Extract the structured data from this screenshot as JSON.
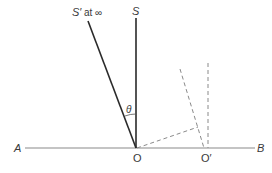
{
  "diagram": {
    "title": "",
    "labels": {
      "S": "S",
      "S_prime": "S′",
      "at_infinity": "at ∞",
      "theta": "θ",
      "A": "A",
      "B": "B",
      "O": "O",
      "O_prime": "O′"
    },
    "colors": {
      "line": "#2a2a2a",
      "baseline": "#8a8a8a",
      "dashed": "#8a8a8a",
      "text": "#3a3a3a"
    }
  }
}
